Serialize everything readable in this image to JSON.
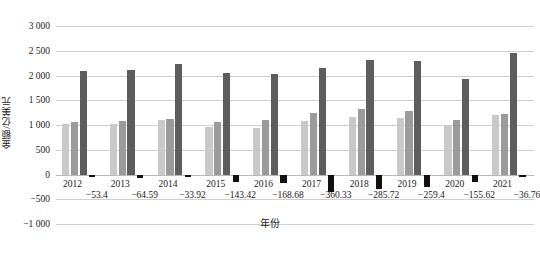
{
  "chart_data": {
    "type": "bar",
    "title": "",
    "subtitle": "",
    "xlabel": "年份",
    "ylabel": "金额/亿美元",
    "ylim": [
      -1000,
      3000
    ],
    "yticks": [
      "3 000",
      "2 500",
      "2 000",
      "1 500",
      "1 000",
      "500",
      "0",
      "−500",
      "−1 000"
    ],
    "ytick_values": [
      3000,
      2500,
      2000,
      1500,
      1000,
      500,
      0,
      -500,
      -1000
    ],
    "grid": true,
    "legend": "none",
    "categories": [
      "2012",
      "2013",
      "2014",
      "2015",
      "2016",
      "2017",
      "2018",
      "2019",
      "2020",
      "2021"
    ],
    "series": [
      {
        "name": "series-1",
        "color": "#c9c9c9",
        "values": [
          1020,
          1020,
          1100,
          970,
          940,
          1090,
          1170,
          1150,
          1000,
          1200
        ]
      },
      {
        "name": "series-2",
        "color": "#9b9b9b",
        "values": [
          1070,
          1080,
          1130,
          1070,
          1100,
          1240,
          1330,
          1290,
          1100,
          1220
        ]
      },
      {
        "name": "series-3",
        "color": "#5d5d5d",
        "values": [
          2090,
          2110,
          2240,
          2050,
          2040,
          2150,
          2320,
          2290,
          1920,
          2450
        ]
      },
      {
        "name": "series-4-negative",
        "color": "#111111",
        "values": [
          -53.4,
          -64.59,
          -33.92,
          -143.42,
          -168.68,
          -360.33,
          -285.72,
          -259.4,
          -155.62,
          -36.76
        ]
      }
    ],
    "data_labels": [
      "−53.4",
      "−64.59",
      "−33.92",
      "−143.42",
      "−168.68",
      "−360.33",
      "−285.72",
      "−259.4",
      "−155.62",
      "−36.76"
    ]
  },
  "colors": {
    "series_1": "#c9c9c9",
    "series_2": "#9b9b9b",
    "series_3": "#5d5d5d",
    "series_4": "#111111",
    "gridline": "#cfcfcf",
    "text": "#1a1a1a",
    "background": "#ffffff"
  }
}
